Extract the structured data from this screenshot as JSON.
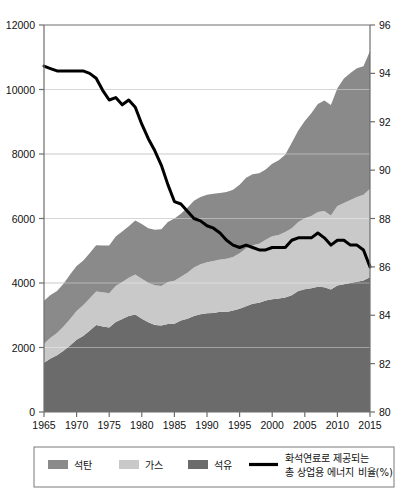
{
  "chart_data": {
    "type": "area",
    "title": "",
    "subtitle": "",
    "xlabel": "",
    "ylabel": "",
    "y2label": "",
    "grid": true,
    "legend_position": "bottom",
    "xlim": [
      1965,
      2015
    ],
    "ylim": [
      0,
      12000
    ],
    "y2lim": [
      80,
      96
    ],
    "x_ticks": [
      "1965",
      "1970",
      "1975",
      "1980",
      "1985",
      "1990",
      "1995",
      "2000",
      "2005",
      "2010",
      "2015"
    ],
    "y_ticks": [
      "0",
      "2000",
      "4000",
      "6000",
      "8000",
      "10000",
      "12000"
    ],
    "y2_ticks": [
      "80",
      "82",
      "84",
      "86",
      "88",
      "90",
      "92",
      "94",
      "96"
    ],
    "x": [
      1965,
      1966,
      1967,
      1968,
      1969,
      1970,
      1971,
      1972,
      1973,
      1974,
      1975,
      1976,
      1977,
      1978,
      1979,
      1980,
      1981,
      1982,
      1983,
      1984,
      1985,
      1986,
      1987,
      1988,
      1989,
      1990,
      1991,
      1992,
      1993,
      1994,
      1995,
      1996,
      1997,
      1998,
      1999,
      2000,
      2001,
      2002,
      2003,
      2004,
      2005,
      2006,
      2007,
      2008,
      2009,
      2010,
      2011,
      2012,
      2013,
      2014,
      2015
    ],
    "stack_order": [
      "oil",
      "gas",
      "coal"
    ],
    "series": [
      {
        "name": "석유",
        "key": "oil",
        "color": "#6b6b6b",
        "stacked": true,
        "values": [
          1530,
          1660,
          1760,
          1900,
          2060,
          2240,
          2360,
          2520,
          2700,
          2650,
          2620,
          2790,
          2880,
          2980,
          3020,
          2890,
          2780,
          2700,
          2680,
          2730,
          2740,
          2840,
          2890,
          2980,
          3030,
          3060,
          3070,
          3110,
          3100,
          3150,
          3200,
          3280,
          3360,
          3390,
          3460,
          3500,
          3520,
          3550,
          3620,
          3750,
          3810,
          3840,
          3880,
          3870,
          3800,
          3920,
          3960,
          4000,
          4040,
          4080,
          4180
        ]
      },
      {
        "name": "가스",
        "key": "gas",
        "color": "#c9c9c9",
        "stacked": true,
        "values": [
          590,
          640,
          690,
          750,
          820,
          890,
          950,
          1000,
          1040,
          1060,
          1060,
          1120,
          1150,
          1180,
          1240,
          1240,
          1230,
          1230,
          1230,
          1300,
          1330,
          1350,
          1430,
          1500,
          1550,
          1580,
          1610,
          1620,
          1650,
          1660,
          1720,
          1800,
          1810,
          1830,
          1880,
          1950,
          1970,
          2030,
          2080,
          2140,
          2200,
          2240,
          2320,
          2360,
          2290,
          2470,
          2520,
          2570,
          2630,
          2660,
          2740
        ]
      },
      {
        "name": "석탄",
        "key": "coal",
        "color": "#8a8a8a",
        "stacked": true,
        "values": [
          1330,
          1330,
          1300,
          1330,
          1380,
          1400,
          1380,
          1400,
          1430,
          1450,
          1480,
          1530,
          1570,
          1600,
          1680,
          1700,
          1690,
          1720,
          1760,
          1860,
          1930,
          1960,
          2010,
          2070,
          2090,
          2100,
          2090,
          2060,
          2070,
          2080,
          2130,
          2180,
          2200,
          2180,
          2180,
          2250,
          2320,
          2400,
          2650,
          2840,
          3010,
          3180,
          3350,
          3430,
          3430,
          3650,
          3860,
          3940,
          3990,
          3980,
          4270
        ]
      }
    ],
    "line_series": {
      "name": "화석연료로 제공되는 총 상업용 에너지 비율(%)",
      "key": "fossil_share",
      "color": "#000000",
      "axis": "right",
      "values": [
        94.3,
        94.2,
        94.1,
        94.1,
        94.1,
        94.1,
        94.1,
        94.0,
        93.8,
        93.3,
        92.9,
        93.0,
        92.7,
        92.9,
        92.6,
        91.9,
        91.3,
        90.8,
        90.2,
        89.4,
        88.7,
        88.6,
        88.3,
        88.0,
        87.9,
        87.7,
        87.6,
        87.4,
        87.1,
        86.9,
        86.8,
        86.9,
        86.8,
        86.7,
        86.7,
        86.8,
        86.8,
        86.8,
        87.1,
        87.2,
        87.2,
        87.2,
        87.4,
        87.2,
        86.9,
        87.1,
        87.1,
        86.9,
        86.9,
        86.7,
        86.0
      ]
    }
  },
  "legend": {
    "items": [
      {
        "label": "석탄",
        "swatch_color": "#8a8a8a",
        "marker": "swatch"
      },
      {
        "label": "가스",
        "swatch_color": "#c9c9c9",
        "marker": "swatch"
      },
      {
        "label": "석유",
        "swatch_color": "#6b6b6b",
        "marker": "swatch"
      }
    ],
    "line_item": {
      "label_line1": "화석연료로 제공되는",
      "label_line2": "총 상업용 에너지 비율(%)",
      "color": "#000000",
      "marker": "line"
    }
  },
  "colors": {
    "coal": "#8a8a8a",
    "gas": "#c9c9c9",
    "oil": "#6b6b6b",
    "line": "#000000",
    "axis": "#6e6e6e",
    "grid": "#bdbdbd",
    "background": "#ffffff"
  }
}
